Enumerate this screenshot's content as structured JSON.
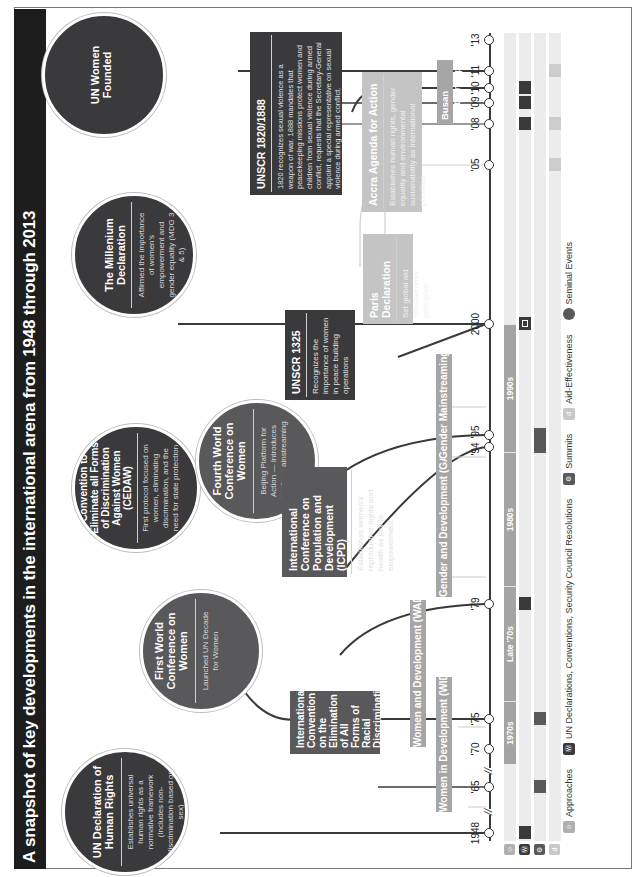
{
  "title": "A snapshot of key developments in the international arena from 1948 through 2013",
  "colors": {
    "dark": "#3a3a3c",
    "mid": "#59595b",
    "light": "#c4c4c4",
    "approach": "#a6a6a6",
    "row_bg": "#ececec",
    "title_bg": "#1d1d1d"
  },
  "seminal_events": [
    {
      "title": "UN Declaration of Human Rights",
      "desc": "Establishes universal human rights as a normative framework (Includes non-discrimination based on sex)"
    },
    {
      "title": "First World Conference on Women",
      "desc": "Launched UN Decade for Women"
    },
    {
      "title": "Convention to Eliminate all Forms of Discrimination Against Women (CEDAW)",
      "desc": "First protocol focused on women, eliminating discrimination, and the need for state protection"
    },
    {
      "title": "Fourth World Conference on Women",
      "desc": "Beijing Platform for Action — Introduces gender mainstreaming"
    },
    {
      "title": "The Millenium Declaration",
      "desc": "Affirmed the importance of women's empowerment and gender equality (MDG 3 & 5)"
    },
    {
      "title": "UN Women Founded",
      "desc": ""
    }
  ],
  "boxes": {
    "racial": {
      "title": "International Convention on the Elimination of All Forms of Racial Discrimination"
    },
    "icpd": {
      "title": "International Conference on Population and Development (ICPD)",
      "desc": "Establishes women's reproductive rights and health as key to empowerment"
    },
    "unscr1325": {
      "title": "UNSCR 1325",
      "desc": "Recognizes the importance of women in peace building operations"
    },
    "unscr1820": {
      "title": "UNSCR 1820/1888",
      "desc": "1820 recognizes sexual violence as a weapon of war. 1888 mandates that peacekeeping missions protect women and children from sexual violence during armed conflict, requests that the Secretary-General appoint a special representative on sexual violence during armed conflict."
    },
    "paris": {
      "title": "Paris Declaration",
      "desc": "Set global aid effectiveness principles"
    },
    "accra": {
      "title": "Accra Agenda for Action",
      "desc": "Establishes human rights, gender equality and environmental sustainability as international priorities"
    },
    "busan": {
      "title": "Busan Partnership"
    }
  },
  "approaches": [
    {
      "label": "Women in Development (WID)"
    },
    {
      "label": "Women and Development (WAD)"
    },
    {
      "label": "Gender and Development (GAD)"
    },
    {
      "label": "Gender Mainstreaming"
    }
  ],
  "timeline": {
    "years": [
      "1948",
      "'65",
      "'70",
      "'75",
      "'79",
      "'94",
      "'95",
      "2000",
      "'05",
      "'08",
      "'09",
      "'10",
      "'11",
      "'13"
    ],
    "break_marks": [
      "//",
      "//"
    ]
  },
  "eras": [
    "1970s",
    "Late '70s",
    "1980s",
    "1990s"
  ],
  "rows": [
    {
      "icon": "approaches-icon",
      "glyph": "☺"
    },
    {
      "icon": "un-declarations-icon",
      "glyph": "Ⓦ"
    },
    {
      "icon": "summits-icon",
      "glyph": "⚙"
    },
    {
      "icon": "aid-effectiveness-icon",
      "glyph": "d"
    }
  ],
  "legend": [
    {
      "label": "Approaches",
      "color": "#b0b0b0",
      "glyph": "☺"
    },
    {
      "label": "UN Declarations, Conventions, Security Council Resolutions",
      "color": "#3a3a3c",
      "glyph": "Ⓦ"
    },
    {
      "label": "Summits",
      "color": "#59595b",
      "glyph": "⚙"
    },
    {
      "label": "Aid-Effectiveness",
      "color": "#c8c8c8",
      "glyph": "d"
    },
    {
      "label": "Seminal Events",
      "color": "#59595b",
      "glyph": ""
    }
  ]
}
